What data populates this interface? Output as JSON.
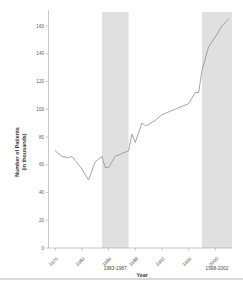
{
  "chart_data": {
    "type": "line",
    "title": "",
    "xlabel": "Year",
    "ylabel": "Number of Patients\n(in thousands)",
    "ylabel_line1": "Number of Patients",
    "ylabel_line2": "(in thousands)",
    "xlim": [
      1975,
      2002.5
    ],
    "ylim": [
      0,
      170
    ],
    "ytick_values": [
      0,
      20,
      40,
      60,
      80,
      100,
      120,
      140,
      160
    ],
    "ytick_labels": [
      "0",
      "20",
      "40",
      "60",
      "80",
      "100",
      "120",
      "140",
      "160"
    ],
    "xtick_values": [
      1976,
      1980,
      1984,
      1988,
      1992,
      1996,
      2000
    ],
    "xtick_labels": [
      "1976",
      "1980",
      "1984",
      "1988",
      "1992",
      "1996",
      "2000"
    ],
    "grid": false,
    "legend": false,
    "line_color": "#9a9a9a",
    "band_color": "#e0e0e0",
    "axis_color": "#b0b0b0",
    "shaded_bands": [
      {
        "label": "1983-1987",
        "start": 1983,
        "end": 1987
      },
      {
        "label": "1998-2002",
        "start": 1998,
        "end": 2002.5
      }
    ],
    "x": [
      1976,
      1977,
      1978,
      1979,
      1980,
      1981,
      1982,
      1983,
      1984,
      1985,
      1986,
      1987,
      1988,
      1989,
      1990,
      1991,
      1992,
      1993,
      1994,
      1995,
      1996,
      1997,
      1998,
      1999,
      2000,
      2001,
      2002
    ],
    "values": [
      70,
      66,
      65,
      66,
      63,
      57,
      49,
      62,
      66,
      58,
      58,
      63,
      69,
      71,
      69,
      76,
      82,
      76,
      90,
      88,
      91,
      94,
      96,
      99,
      102,
      101,
      104
    ],
    "series": [
      {
        "name": "Number of Patients (in thousands)",
        "x": [
          1976,
          1977,
          1978,
          1978.5,
          1979,
          1980,
          1981,
          1982,
          1983,
          1983.5,
          1984,
          1984.5,
          1985,
          1986,
          1987,
          1987.5,
          1988,
          1989,
          1989.5,
          1990,
          1991,
          1992,
          1993,
          1994,
          1995,
          1996,
          1997,
          1997.5,
          1998,
          1999,
          2000,
          2001,
          2002
        ],
        "values": [
          70,
          66,
          65,
          66,
          63,
          57,
          49,
          62,
          66,
          58,
          58,
          62,
          66,
          68,
          70,
          82,
          76,
          90,
          88,
          89,
          92,
          96,
          98,
          100,
          102,
          104,
          112,
          112,
          128,
          145,
          152,
          160,
          165
        ]
      }
    ]
  }
}
